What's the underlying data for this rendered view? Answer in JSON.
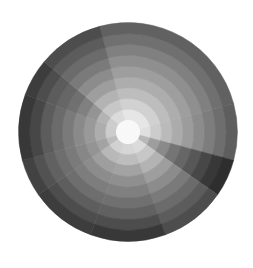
{
  "chart_data": {
    "type": "heatmap",
    "subtype": "polar",
    "title": "",
    "xlabel": "",
    "ylabel": "",
    "colormap": "grayscale",
    "center": [
      128,
      132
    ],
    "outer_radius": 109,
    "inner_radius": 12,
    "center_color": "#f8f8f8",
    "ring_count": 9,
    "sectors": [
      {
        "start": 345,
        "end": 75,
        "values": [
          0.9,
          0.82,
          0.74,
          0.68,
          0.62,
          0.56,
          0.5,
          0.44,
          0.38
        ]
      },
      {
        "start": 75,
        "end": 105,
        "values": [
          0.88,
          0.8,
          0.73,
          0.67,
          0.61,
          0.55,
          0.49,
          0.43,
          0.37
        ]
      },
      {
        "start": 105,
        "end": 125,
        "values": [
          0.72,
          0.62,
          0.54,
          0.46,
          0.4,
          0.34,
          0.28,
          0.22,
          0.18
        ]
      },
      {
        "start": 125,
        "end": 160,
        "values": [
          0.86,
          0.78,
          0.7,
          0.62,
          0.55,
          0.48,
          0.42,
          0.36,
          0.3
        ]
      },
      {
        "start": 160,
        "end": 200,
        "values": [
          0.84,
          0.74,
          0.64,
          0.56,
          0.5,
          0.44,
          0.38,
          0.3,
          0.22
        ]
      },
      {
        "start": 200,
        "end": 235,
        "values": [
          0.82,
          0.72,
          0.62,
          0.55,
          0.49,
          0.43,
          0.37,
          0.3,
          0.24
        ]
      },
      {
        "start": 235,
        "end": 255,
        "values": [
          0.74,
          0.64,
          0.58,
          0.53,
          0.48,
          0.43,
          0.38,
          0.32,
          0.26
        ]
      },
      {
        "start": 255,
        "end": 290,
        "values": [
          0.8,
          0.68,
          0.6,
          0.54,
          0.48,
          0.42,
          0.36,
          0.28,
          0.22
        ]
      },
      {
        "start": 290,
        "end": 310,
        "values": [
          0.8,
          0.7,
          0.58,
          0.5,
          0.44,
          0.4,
          0.36,
          0.3,
          0.24
        ]
      },
      {
        "start": 310,
        "end": 345,
        "values": [
          0.86,
          0.78,
          0.7,
          0.62,
          0.55,
          0.48,
          0.42,
          0.36,
          0.3
        ]
      }
    ],
    "legend": null,
    "grid": false
  }
}
